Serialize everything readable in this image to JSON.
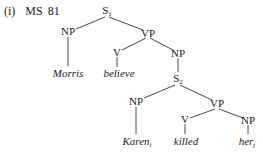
{
  "example": {
    "number": "(i)",
    "source": "MS 81"
  },
  "tree": {
    "nodes": {
      "s1": {
        "label": "S",
        "sub": "1"
      },
      "np1": {
        "label": "NP"
      },
      "vp1": {
        "label": "VP"
      },
      "v1": {
        "label": "V"
      },
      "np2": {
        "label": "NP"
      },
      "morris": {
        "label": "Morris"
      },
      "believe": {
        "label": "believe"
      },
      "s2": {
        "label": "S",
        "sub": "2"
      },
      "np3": {
        "label": "NP"
      },
      "vp2": {
        "label": "VP"
      },
      "v2": {
        "label": "V"
      },
      "np4": {
        "label": "NP"
      },
      "karen": {
        "label": "Karen",
        "sub": "i"
      },
      "killed": {
        "label": "killed"
      },
      "her": {
        "label": "her",
        "sub": "j"
      }
    },
    "edges": [
      [
        "S1",
        "NP"
      ],
      [
        "S1",
        "VP"
      ],
      [
        "NP",
        "Morris"
      ],
      [
        "VP",
        "V"
      ],
      [
        "VP",
        "NP"
      ],
      [
        "V",
        "believe"
      ],
      [
        "NP",
        "S2"
      ],
      [
        "S2",
        "NP"
      ],
      [
        "S2",
        "VP"
      ],
      [
        "NP",
        "Karen_i"
      ],
      [
        "VP",
        "V"
      ],
      [
        "VP",
        "NP"
      ],
      [
        "V",
        "killed"
      ],
      [
        "NP",
        "her_j"
      ]
    ]
  }
}
